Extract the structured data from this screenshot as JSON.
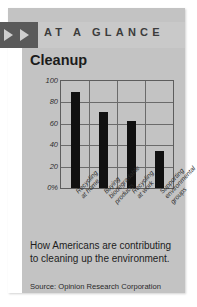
{
  "header": {
    "kicker": "AT A GLANCE",
    "arrow_icon_1": "play-triangle-icon",
    "arrow_icon_2": "play-triangle-icon"
  },
  "card": {
    "title": "Cleanup",
    "caption": "How Americans are contributing to cleaning up the environment.",
    "source": "Source: Opinion Research Corporation"
  },
  "colors": {
    "card_bg": "#c3c3c3",
    "header_block": "#5a5a5a",
    "bar": "#111111",
    "axis": "#5d5d5d"
  },
  "chart_data": {
    "type": "bar",
    "title": "Cleanup",
    "xlabel": "",
    "ylabel": "",
    "ylim": [
      0,
      100
    ],
    "grid": true,
    "legend": "none",
    "ytick_labels": [
      "100",
      "80",
      "60",
      "40",
      "20",
      "0%"
    ],
    "ytick_values": [
      100,
      80,
      60,
      40,
      20,
      0
    ],
    "categories": [
      "Recycling at home",
      "Buying biodegradable products",
      "Recycling at work",
      "Supporting environmental groups"
    ],
    "category_lines": [
      [
        "Recycling",
        "at home"
      ],
      [
        "Buying",
        "biodegradable",
        "products"
      ],
      [
        "Recycling",
        "at work"
      ],
      [
        "Supporting",
        "environmental",
        "groups"
      ]
    ],
    "values": [
      90,
      71,
      63,
      35
    ]
  }
}
